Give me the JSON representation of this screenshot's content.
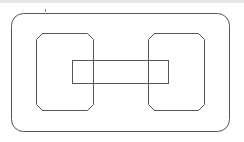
{
  "diagram": {
    "stroke_color": "#555555",
    "background": "#ffffff",
    "top_strip_color": "#e6e6e6",
    "shapes": {
      "outer": {
        "x": 11,
        "y": 13,
        "w": 218,
        "h": 118,
        "rx": 12
      },
      "left_box": {
        "x": 36,
        "y": 33,
        "w": 57,
        "h": 77,
        "chamfer": 6
      },
      "right_box": {
        "x": 148,
        "y": 33,
        "w": 56,
        "h": 77,
        "chamfer": 6
      },
      "bar": {
        "x": 72,
        "y": 60,
        "w": 96,
        "h": 23
      }
    }
  }
}
